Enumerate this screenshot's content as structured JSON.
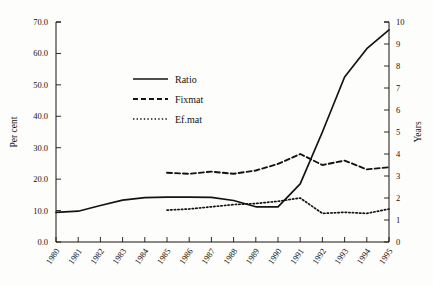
{
  "chart_data": {
    "type": "line",
    "title": "",
    "xlabel": "",
    "ylabel": "Per cent",
    "ylabel_right": "Years",
    "x": [
      1980,
      1981,
      1982,
      1983,
      1984,
      1985,
      1986,
      1987,
      1988,
      1989,
      1990,
      1991,
      1992,
      1993,
      1994,
      1995
    ],
    "xtick_labels": [
      "1980",
      "1981",
      "1982",
      "1983",
      "1984",
      "1985",
      "1986",
      "1987",
      "1988",
      "1989",
      "1990",
      "1991",
      "1992",
      "1993",
      "1994",
      "1995"
    ],
    "ylim": [
      0.0,
      70.0
    ],
    "ytick_values": [
      0.0,
      10.0,
      20.0,
      30.0,
      40.0,
      50.0,
      60.0,
      70.0
    ],
    "ytick_labels": [
      "0.0",
      "10.0",
      "20.0",
      "30.0",
      "40.0",
      "50.0",
      "60.0",
      "70.0"
    ],
    "ylim_right": [
      0,
      10
    ],
    "ytick_values_right": [
      0,
      1,
      2,
      3,
      4,
      5,
      6,
      7,
      8,
      9,
      10
    ],
    "ytick_labels_right": [
      "0",
      "1",
      "2",
      "3",
      "4",
      "5",
      "6",
      "7",
      "8",
      "9",
      "10"
    ],
    "grid": false,
    "legend_position": "upper-left-inside",
    "series": [
      {
        "name": "Ratio",
        "axis": "left",
        "style": "solid",
        "x": [
          1980,
          1981,
          1982,
          1983,
          1984,
          1985,
          1986,
          1987,
          1988,
          1989,
          1990,
          1991,
          1992,
          1993,
          1994,
          1995
        ],
        "values": [
          9.4,
          9.8,
          11.6,
          13.3,
          14.1,
          14.3,
          14.3,
          14.2,
          13.2,
          11.2,
          11.2,
          18.5,
          35.0,
          52.5,
          61.5,
          67.5
        ]
      },
      {
        "name": "Fixmat",
        "axis": "right",
        "style": "dashed",
        "x": [
          1985,
          1986,
          1987,
          1988,
          1989,
          1990,
          1991,
          1992,
          1993,
          1994,
          1995
        ],
        "values": [
          3.15,
          3.1,
          3.2,
          3.1,
          3.25,
          3.55,
          4.0,
          3.5,
          3.7,
          3.3,
          3.4
        ]
      },
      {
        "name": "Ef.mat",
        "axis": "right",
        "style": "dotted",
        "x": [
          1985,
          1986,
          1987,
          1988,
          1989,
          1990,
          1991,
          1992,
          1993,
          1994,
          1995
        ],
        "values": [
          1.45,
          1.5,
          1.6,
          1.7,
          1.75,
          1.85,
          2.0,
          1.3,
          1.35,
          1.3,
          1.5
        ]
      }
    ]
  },
  "legend": {
    "items": [
      {
        "label": "Ratio",
        "style": "solid"
      },
      {
        "label": "Fixmat",
        "style": "dashed"
      },
      {
        "label": "Ef.mat",
        "style": "dotted"
      }
    ]
  }
}
